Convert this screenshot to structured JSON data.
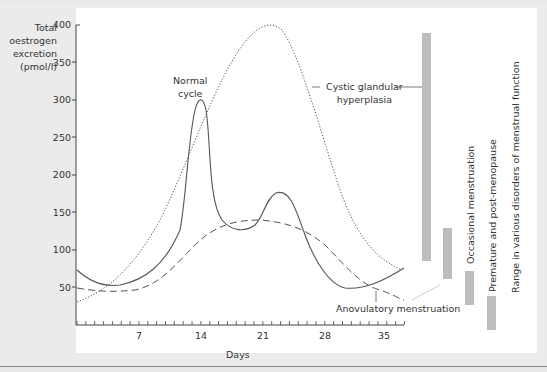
{
  "chart_data": {
    "type": "line",
    "title": "",
    "ylabel": "Total oestrogen excretion (pmol/l)",
    "xlabel": "Days",
    "ylim": [
      0,
      400
    ],
    "xlim": [
      0,
      37
    ],
    "y_ticks": [
      50,
      100,
      150,
      200,
      250,
      300,
      350,
      400
    ],
    "x_ticks": [
      7,
      14,
      21,
      28,
      35
    ],
    "grid": false,
    "series": [
      {
        "name": "Normal cycle",
        "style": "solid",
        "x": [
          0,
          2,
          4,
          7,
          10,
          12,
          13,
          14,
          15,
          17,
          19,
          21,
          22.5,
          24,
          26,
          28,
          30,
          32,
          34,
          36
        ],
        "y": [
          70,
          58,
          53,
          57,
          85,
          175,
          300,
          270,
          170,
          132,
          127,
          150,
          178,
          165,
          115,
          75,
          52,
          50,
          68,
          105
        ]
      },
      {
        "name": "Cystic glandular hyperplasia",
        "style": "dotted",
        "x": [
          0,
          3,
          6,
          9,
          12,
          15,
          18,
          21,
          23,
          24,
          26,
          28,
          30,
          33,
          36
        ],
        "y": [
          30,
          48,
          78,
          130,
          200,
          275,
          340,
          385,
          395,
          390,
          340,
          250,
          180,
          130,
          110
        ]
      },
      {
        "name": "Anovulatory menstruation",
        "style": "dashed",
        "x": [
          0,
          3,
          6,
          9,
          12,
          15,
          18,
          21,
          24,
          27,
          30,
          33,
          36
        ],
        "y": [
          47,
          43,
          47,
          65,
          100,
          120,
          125,
          122,
          113,
          95,
          65,
          45,
          33
        ]
      }
    ],
    "range_bars": [
      {
        "label": "Cystic glandular hyperplasia",
        "min": 85,
        "max": 390
      },
      {
        "label": "Anovulatory menstruation",
        "min": 62,
        "max": 132
      },
      {
        "label": "Occasional menstruation",
        "min": 32,
        "max": 70
      },
      {
        "label": "Premature and post-menopause",
        "min": 5,
        "max": 38
      }
    ],
    "annotations": [
      "Normal cycle",
      "Cystic glandular hyperplasia",
      "Anovulatory menstruation"
    ],
    "side_title": "Range in various disorders of menstrual function"
  },
  "labels": {
    "ylabel_lines": [
      "Total",
      "oestrogen",
      "excretion",
      "(pmol/l)"
    ],
    "y_ticks": [
      "400",
      "350",
      "300",
      "250",
      "200",
      "150",
      "100",
      "50"
    ],
    "x_ticks": [
      "7",
      "14",
      "21",
      "28",
      "35"
    ],
    "xlabel": "Days",
    "normal_cycle_lines": [
      "Normal",
      "cycle"
    ],
    "cystic_lines": [
      "Cystic glandular",
      "hyperplasia"
    ],
    "anovulatory": "Anovulatory menstruation",
    "occasional": "Occasional menstruation",
    "premature": "Premature and post-menopause",
    "range_title": "Range in various disorders of menstrual function"
  },
  "colors": {
    "curve": "#555555",
    "bar": "#bdbdbd",
    "background": "#ebebeb",
    "plot": "#ffffff"
  }
}
